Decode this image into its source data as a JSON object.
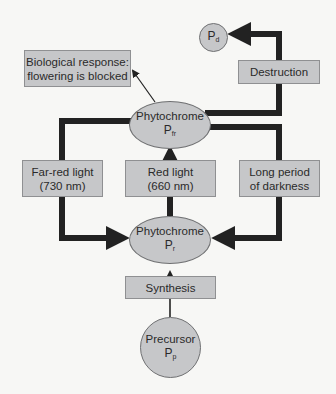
{
  "colors": {
    "box_fill": "#c6c7c9",
    "arrow": "#222222",
    "background": "#f7f7f5"
  },
  "nodes": {
    "pd": {
      "symbol": "P",
      "subscript": "d"
    },
    "pfr": {
      "label": "Phytochrome",
      "symbol": "P",
      "subscript": "fr"
    },
    "pr": {
      "label": "Phytochrome",
      "symbol": "P",
      "subscript": "r"
    },
    "precursor": {
      "label": "Precursor",
      "symbol": "P",
      "subscript": "p"
    }
  },
  "boxes": {
    "destruction": {
      "line1": "Destruction"
    },
    "biological_response": {
      "line1": "Biological response:",
      "line2": "flowering is blocked"
    },
    "far_red": {
      "line1": "Far-red light",
      "line2": "(730 nm)"
    },
    "red_light": {
      "line1": "Red light",
      "line2": "(660 nm)"
    },
    "darkness": {
      "line1": "Long period",
      "line2": "of darkness"
    },
    "synthesis": {
      "line1": "Synthesis"
    }
  },
  "edges": [
    {
      "from": "precursor",
      "to": "pr",
      "via": "synthesis"
    },
    {
      "from": "pr",
      "to": "pfr",
      "via": "red_light"
    },
    {
      "from": "pfr",
      "to": "pr",
      "via": "far_red"
    },
    {
      "from": "pfr",
      "to": "pr",
      "via": "darkness"
    },
    {
      "from": "pfr",
      "to": "pd",
      "via": "destruction"
    },
    {
      "from": "pfr",
      "to": "biological_response"
    }
  ]
}
